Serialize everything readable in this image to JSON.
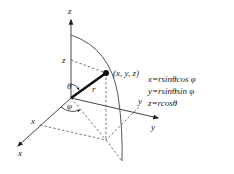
{
  "diagram": {
    "axes": {
      "z_label": "z",
      "x_label": "x",
      "y_label": "y"
    },
    "marks": {
      "z_mark": "z",
      "x_mark": "x",
      "y_mark": "y"
    },
    "point_label": "(x, y, z)",
    "radius_label": "r",
    "polar_angle_label": "θ",
    "azimuth_angle_label": "φ",
    "equations": [
      "x=rsinθcos φ",
      "y=rsinθsin φ",
      "z=rcosθ"
    ],
    "colors": {
      "line": "#333333",
      "dashed": "#555555",
      "text": "#222222"
    }
  }
}
